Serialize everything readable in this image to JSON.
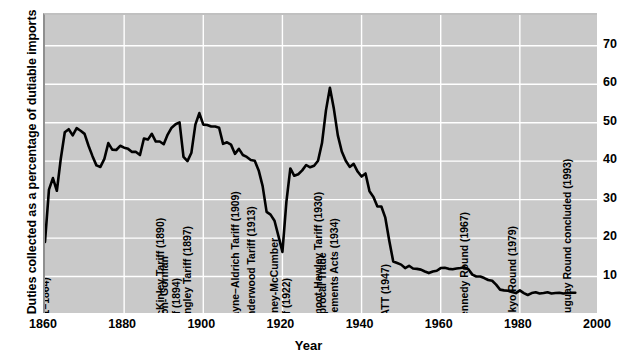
{
  "chart_data": {
    "type": "line",
    "title": "",
    "xlabel": "Year",
    "ylabel": "Duties collected as a percentage of dutiable imports",
    "xlim": [
      1860,
      2000
    ],
    "ylim": [
      0,
      78
    ],
    "xticks": [
      1860,
      1880,
      1900,
      1920,
      1940,
      1960,
      1980,
      2000
    ],
    "yticks": [
      10,
      20,
      30,
      40,
      50,
      60,
      70
    ],
    "grid": true,
    "legend": "none",
    "series": [
      {
        "name": "Duties collected as a percentage of dutiable imports",
        "color": "#000000",
        "x": [
          1860,
          1861,
          1862,
          1863,
          1864,
          1865,
          1866,
          1867,
          1868,
          1869,
          1870,
          1871,
          1872,
          1873,
          1874,
          1875,
          1876,
          1877,
          1878,
          1879,
          1880,
          1881,
          1882,
          1883,
          1884,
          1885,
          1886,
          1887,
          1888,
          1889,
          1890,
          1891,
          1892,
          1893,
          1894,
          1895,
          1896,
          1897,
          1898,
          1899,
          1900,
          1901,
          1902,
          1903,
          1904,
          1905,
          1906,
          1907,
          1908,
          1909,
          1910,
          1911,
          1912,
          1913,
          1914,
          1915,
          1916,
          1917,
          1918,
          1919,
          1920,
          1921,
          1922,
          1923,
          1924,
          1925,
          1926,
          1927,
          1928,
          1929,
          1930,
          1931,
          1932,
          1933,
          1934,
          1935,
          1936,
          1937,
          1938,
          1939,
          1940,
          1941,
          1942,
          1943,
          1944,
          1945,
          1946,
          1947,
          1948,
          1949,
          1950,
          1951,
          1952,
          1953,
          1954,
          1955,
          1956,
          1957,
          1958,
          1959,
          1960,
          1961,
          1962,
          1963,
          1964,
          1965,
          1966,
          1967,
          1968,
          1969,
          1970,
          1971,
          1972,
          1973,
          1974,
          1975,
          1976,
          1977,
          1978,
          1979,
          1980,
          1981,
          1982,
          1983,
          1984,
          1985,
          1986,
          1987,
          1988,
          1989,
          1990,
          1991,
          1992,
          1993,
          1994
        ],
        "y": [
          19.0,
          32.6,
          35.6,
          32.3,
          40.7,
          47.5,
          48.3,
          46.7,
          48.6,
          47.9,
          47.1,
          44.0,
          41.3,
          38.9,
          38.5,
          40.6,
          44.7,
          43.0,
          42.9,
          44.0,
          43.5,
          43.2,
          42.4,
          42.4,
          41.6,
          45.9,
          45.6,
          47.1,
          45.1,
          45.1,
          44.4,
          46.9,
          48.7,
          49.6,
          50.1,
          41.1,
          40.0,
          42.2,
          49.5,
          52.5,
          49.5,
          49.4,
          49.0,
          49.0,
          48.7,
          44.5,
          44.9,
          44.3,
          41.9,
          43.2,
          41.6,
          41.1,
          40.3,
          40.1,
          37.6,
          33.5,
          26.8,
          26.1,
          24.5,
          20.5,
          16.4,
          29.4,
          38.1,
          36.2,
          36.6,
          37.6,
          39.0,
          38.4,
          38.8,
          40.1,
          44.7,
          53.2,
          59.1,
          53.6,
          46.7,
          42.5,
          40.1,
          38.5,
          39.3,
          37.3,
          36.0,
          36.8,
          32.2,
          30.7,
          28.2,
          28.2,
          25.3,
          19.3,
          13.9,
          13.5,
          13.1,
          12.2,
          12.8,
          12.1,
          12.0,
          11.8,
          11.3,
          10.9,
          11.3,
          11.5,
          12.2,
          12.3,
          12.0,
          11.9,
          12.1,
          12.2,
          12.4,
          11.9,
          10.5,
          10.0,
          10.0,
          9.6,
          9.1,
          8.9,
          7.9,
          6.6,
          6.4,
          6.3,
          6.0,
          5.7,
          6.4,
          5.7,
          5.2,
          5.7,
          5.9,
          5.6,
          5.7,
          5.9,
          5.6,
          5.7,
          5.8,
          5.6,
          5.7,
          5.8,
          5.8
        ]
      }
    ],
    "annotations": [
      {
        "id": "morrill",
        "label": "Morrill and War Tariffs\n(1861–1864)",
        "year": 1861,
        "lines": [
          "Morrill and War Tariffs",
          "(1861–1864)"
        ]
      },
      {
        "id": "mckinley",
        "label": "McKinley Tariff (1890)",
        "year": 1890,
        "lines": [
          "McKinley Tariff (1890)"
        ]
      },
      {
        "id": "dingley",
        "label": "Dingley Tariff (1897)",
        "year": 1897,
        "lines": [
          "Dingley Tariff (1897)"
        ]
      },
      {
        "id": "payne-aldrich",
        "label": "Payne–Aldrich Tariff (1909)",
        "year": 1909,
        "lines": [
          "Payne–Aldrich Tariff (1909)"
        ]
      },
      {
        "id": "wilson-gorman",
        "label": "Wilson- Gorman Tariff (1894)",
        "year": 1894,
        "lines": [
          "Wilson- Gorman",
          "Tariff (1894)"
        ]
      },
      {
        "id": "underwood",
        "label": "Underwood Tariff (1913)",
        "year": 1913,
        "lines": [
          "Underwood Tariff (1913)"
        ]
      },
      {
        "id": "fordney",
        "label": "Fordney-McCumber Tariff (1922)",
        "year": 1922,
        "lines": [
          "Fordney-McCumber",
          "Tariff (1922)"
        ]
      },
      {
        "id": "smoot-hawley",
        "label": "Smoot-Hawley Tariff (1930)",
        "year": 1930,
        "lines": [
          "Smoot-Hawley Tariff (1930)"
        ]
      },
      {
        "id": "reciprocal",
        "label": "Reciprocal Trade Agreements Acts (1934)",
        "year": 1934,
        "lines": [
          "Reciprocal Trade",
          "Agreements Acts (1934)"
        ]
      },
      {
        "id": "gatt",
        "label": "GATT (1947)",
        "year": 1947,
        "lines": [
          "GATT (1947)"
        ]
      },
      {
        "id": "kennedy",
        "label": "Kennedy Round (1967)",
        "year": 1967,
        "lines": [
          "Kennedy Round (1967)"
        ]
      },
      {
        "id": "tokyo",
        "label": "Tokyo Round (1979)",
        "year": 1979,
        "lines": [
          "Tokyo Round (1979)"
        ]
      },
      {
        "id": "uruguay",
        "label": "Uruguay Round concluded (1993)",
        "year": 1993,
        "lines": [
          "Uruguay Round concluded (1993)"
        ]
      }
    ]
  },
  "colors": {
    "plot_background": "#c9c9c9",
    "grid": "#ffffff",
    "line": "#000000",
    "page_background": "#ffffff",
    "text": "#000000"
  },
  "axis": {
    "y_title": "Duties collected as a percentage of dutiable imports",
    "x_title": "Year",
    "y_ticks": [
      "70",
      "60",
      "50",
      "40",
      "30",
      "20",
      "10"
    ],
    "x_ticks": [
      "1860",
      "1880",
      "1900",
      "1920",
      "1940",
      "1960",
      "1980",
      "2000"
    ]
  }
}
